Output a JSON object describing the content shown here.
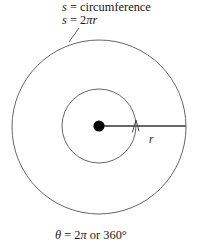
{
  "figure": {
    "name": "circle-radius-circumference-diagram",
    "background_color": "#ffffff",
    "width": 201,
    "height": 248
  },
  "labels": {
    "circumference": {
      "full_text": "s = circumference",
      "symbol": "s",
      "relation": " = circumference"
    },
    "arc_length": {
      "full_text": "s = 2πr",
      "symbol": "s",
      "equals": " = ",
      "coefficient": "2",
      "pi": "π",
      "radius_symbol": "r"
    },
    "angle": {
      "full_text": "θ = 2π or 360°",
      "theta": "θ",
      "equals": " = ",
      "value_radians": "2",
      "pi": "π",
      "conjunction": " or ",
      "value_degrees": "360°"
    },
    "radius": {
      "full_text": "r",
      "symbol": "r"
    }
  },
  "geometry": {
    "outer_circle": {
      "name": "outer-circle",
      "center_x": 99,
      "center_y": 127,
      "radius": 87,
      "stroke": "#555555",
      "stroke_width": 0.9,
      "fill": "none"
    },
    "inner_circle": {
      "name": "inner-circle",
      "center_x": 99,
      "center_y": 126,
      "radius": 37,
      "stroke": "#555555",
      "stroke_width": 0.9,
      "fill": "none"
    },
    "center_dot": {
      "name": "center-point-dot",
      "center_x": 99,
      "center_y": 126,
      "radius": 5.6,
      "fill": "#000000"
    },
    "radius_line": {
      "name": "radius-line",
      "x1": 99,
      "y1": 126,
      "x2": 186,
      "y2": 126,
      "stroke": "#666666",
      "stroke_width": 2.0
    },
    "radius_arrow": {
      "name": "radius-arrowhead",
      "tip_x": 136,
      "tip_y": 120,
      "stroke": "#444444",
      "stroke_width": 0.9
    },
    "leader_line": {
      "name": "label-leader-line",
      "x1": 79,
      "y1": 28,
      "x2": 69,
      "y2": 42,
      "stroke": "#555555",
      "stroke_width": 0.9
    }
  },
  "colors": {
    "ink": "#1a1a1a",
    "stroke": "#555555",
    "line": "#666666",
    "dot": "#000000",
    "background": "#ffffff"
  }
}
